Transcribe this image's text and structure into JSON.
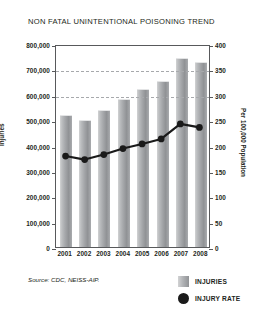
{
  "chart_data": {
    "type": "bar",
    "title": "NON FATAL UNINTENTIONAL POISONING TREND",
    "categories": [
      "2001",
      "2002",
      "2003",
      "2004",
      "2005",
      "2006",
      "2007",
      "2008"
    ],
    "xlabel": "",
    "ylabel": "Injuries",
    "ylabel_secondary": "Per 100,000 Population",
    "ylim": [
      0,
      800000
    ],
    "ylim_secondary": [
      0,
      400
    ],
    "yticks": [
      "0",
      "100,000",
      "200,000",
      "300,000",
      "400,000",
      "500,000",
      "600,000",
      "700,000",
      "800,000"
    ],
    "ytick_values": [
      0,
      100000,
      200000,
      300000,
      400000,
      500000,
      600000,
      700000,
      800000
    ],
    "yticks_secondary": [
      "0",
      "50",
      "100",
      "150",
      "200",
      "250",
      "300",
      "350",
      "400"
    ],
    "ytick_values_secondary": [
      0,
      50,
      100,
      150,
      200,
      250,
      300,
      350,
      400
    ],
    "grid": true,
    "gridlines_at": [
      600000,
      700000
    ],
    "legend_position": "bottom-right",
    "series": [
      {
        "name": "INJURIES",
        "type": "bar",
        "axis": "left",
        "color": "#a6a8ab",
        "values": [
          517000,
          497000,
          535000,
          580000,
          620000,
          650000,
          740000,
          725000
        ]
      },
      {
        "name": "INJURY RATE",
        "type": "line",
        "axis": "right",
        "color": "#1a1a1a",
        "values": [
          181,
          174,
          184,
          196,
          205,
          215,
          245,
          238
        ]
      }
    ],
    "source": "Source: CDC, NEISS-AIP."
  },
  "legend": {
    "items": [
      {
        "label": "INJURIES",
        "marker": "square-swatch-icon"
      },
      {
        "label": "INJURY RATE",
        "marker": "circle-marker-icon"
      }
    ]
  }
}
